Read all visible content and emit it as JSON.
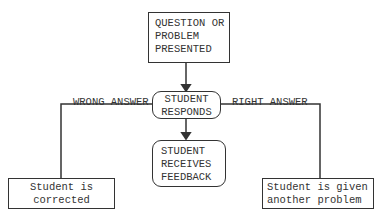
{
  "nodes": {
    "question": {
      "lines": [
        "QUESTION OR",
        "PROBLEM",
        "PRESENTED"
      ]
    },
    "responds": {
      "lines": [
        "STUDENT",
        "RESPONDS"
      ]
    },
    "feedback": {
      "lines": [
        "STUDENT",
        "RECEIVES",
        "FEEDBACK"
      ]
    },
    "corrected": {
      "lines": [
        "Student is",
        "corrected"
      ]
    },
    "another": {
      "lines": [
        "Student is given",
        "another problem"
      ]
    }
  },
  "edges": {
    "wrong": "WRONG ANSWER",
    "right": "RIGHT ANSWER"
  }
}
